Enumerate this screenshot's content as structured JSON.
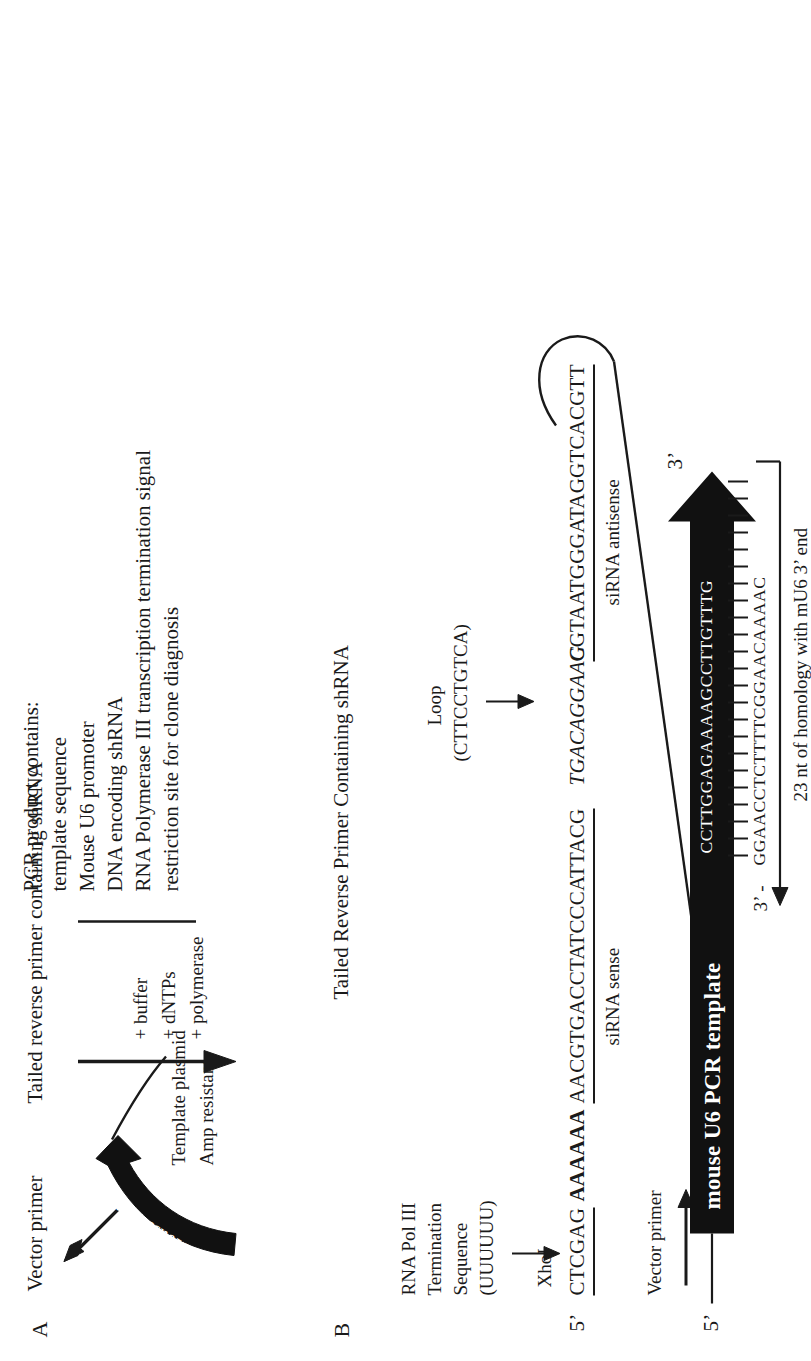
{
  "figure": {
    "panels": [
      {
        "id": "A",
        "letter": "A"
      },
      {
        "id": "B",
        "letter": "B"
      }
    ]
  },
  "panelA": {
    "letter": "A",
    "vector_primer_label": "Vector primer",
    "tailed_reverse_primer_label": "Tailed reverse primer containing shRNA",
    "promoter_ribbon_label": "Mouse U6 promoter",
    "template_plasmid_line1": "Template plasmid",
    "template_plasmid_line2": "Amp resistant",
    "reaction_components": [
      "+ buffer",
      "+ dNTPs",
      "+ polymerase"
    ],
    "pcr_product_heading": "PCR product contains:",
    "pcr_product_items": [
      "template sequence",
      "Mouse U6 promoter",
      "DNA encoding shRNA",
      "RNA Polymerase III transcription termination signal",
      "restriction site for clone diagnosis"
    ]
  },
  "panelB": {
    "letter": "B",
    "title": "Tailed Reverse Primer Containing shRNA",
    "five_prime_label": "5’",
    "three_prime_label": "3’",
    "three_prime_bottom_label": "3’ -",
    "xhoI_label": "XhoI",
    "xhoI_sequence": "CTCGAG",
    "pol3_term_label_lines": [
      "RNA Pol III",
      "Termination",
      "Sequence",
      "(UUUUUU)"
    ],
    "pol3_term_sequence": "AAAAAA",
    "sirna_sense_sequence": "AACGTGACCTATCCCATTACG",
    "sirna_sense_label": "siRNA sense",
    "loop_label_lines": [
      "Loop",
      "(CTTCCTGTCA)"
    ],
    "loop_sequence": "TGACAGGAAG",
    "sirna_antisense_sequence": "CGTAATGGGATAGGTCACGTT",
    "sirna_antisense_label": "siRNA antisense",
    "vector_primer_label": "Vector primer",
    "template_arrow_label": "mouse U6 PCR template",
    "template_top_strand": "CCTTGGAGAAAAGCCTTGTTTG",
    "primer_bottom_strand": "GGAACCTCTTTTCGGAACAAAAC",
    "homology_label": "23 nt of homology with mU6 3’ end"
  },
  "colors": {
    "ink": "#1a1a1a",
    "paper": "#ffffff",
    "ribbon": "#111111"
  }
}
